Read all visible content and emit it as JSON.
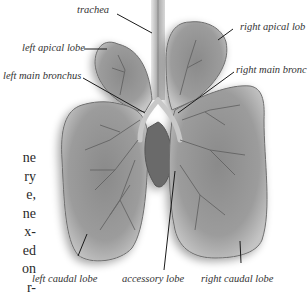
{
  "figure": {
    "labels": {
      "trachea": "trachea",
      "left_apical_lobe": "left apical lobe",
      "left_main_bronchus": "left main bronchus",
      "right_apical_lobe": "right apical lob",
      "right_main_bronchus": "right main bronc",
      "left_caudal_lobe": "left caudal lobe",
      "accessory_lobe": "accessory lobe",
      "right_caudal_lobe": "right caudal lobe"
    },
    "colors": {
      "lobe_fill": "#9a9a9a",
      "lobe_edge": "#6e6e6e",
      "lobe_highlight": "#c8c8c8",
      "vessel": "#5e5e5e",
      "leader_line": "#1a1a1a"
    }
  },
  "body_text_fragments": [
    "ne",
    "ry",
    "e,",
    "ne",
    "x-",
    "ed",
    "on",
    "r-"
  ]
}
